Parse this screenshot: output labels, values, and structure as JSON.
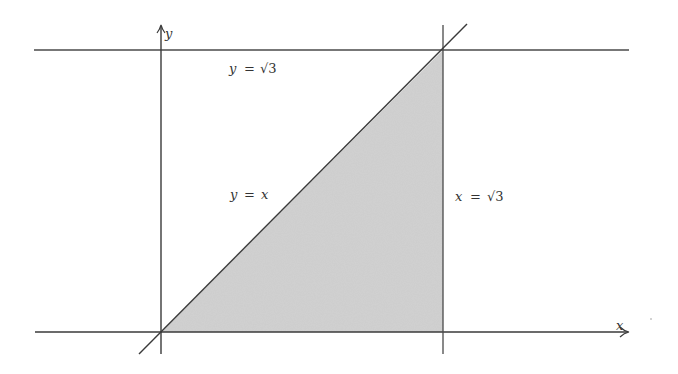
{
  "figure": {
    "axes": {
      "x_label": "x",
      "y_label": "y"
    },
    "curves": [
      {
        "id": "line-y-eq-x",
        "label_lhs": "y",
        "label_op": "=",
        "label_rhs": "x"
      },
      {
        "id": "line-y-eq-sqrt3",
        "label_lhs": "y",
        "label_op": "=",
        "label_rhs": "√3"
      },
      {
        "id": "line-x-eq-sqrt3",
        "label_lhs": "x",
        "label_op": "=",
        "label_rhs": "√3"
      }
    ],
    "colors": {
      "line": "#444444",
      "fill": "#d4d4d4",
      "background": "#ffffff"
    },
    "region": {
      "vertices": [
        [
          0,
          0
        ],
        [
          1.732,
          0
        ],
        [
          1.732,
          1.732
        ]
      ],
      "shaded": true
    }
  }
}
